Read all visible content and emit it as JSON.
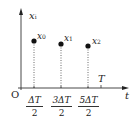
{
  "diagram": {
    "y_axis_label": "x",
    "y_axis_sub": "i",
    "x_axis_label": "t",
    "origin_label": "O",
    "period_label": "T",
    "points": [
      {
        "name": "x",
        "sub": "0",
        "t_num": "ΔT",
        "t_den": "2"
      },
      {
        "name": "x",
        "sub": "1",
        "t_num": "3ΔT",
        "t_den": "2"
      },
      {
        "name": "x",
        "sub": "2",
        "t_num": "5ΔT",
        "t_den": "2"
      }
    ],
    "colors": {
      "ink": "#222222",
      "background": "#ffffff"
    }
  }
}
